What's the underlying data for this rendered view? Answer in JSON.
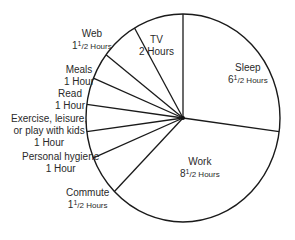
{
  "chart_data": {
    "type": "pie",
    "title": "",
    "unit": "Hours",
    "total": 24,
    "start_angle_deg": -90,
    "direction": "clockwise",
    "slices": [
      {
        "name": "Sleep",
        "value": 6.5,
        "label": "6 1/2 Hours"
      },
      {
        "name": "Work",
        "value": 8.5,
        "label": "8 1/2 Hours"
      },
      {
        "name": "Commute",
        "value": 1.5,
        "label": "1 1/2 Hours"
      },
      {
        "name": "Personal hygiene",
        "value": 1,
        "label": "1 Hour"
      },
      {
        "name": "Exercise, leisure, or play with kids",
        "value": 1,
        "label": "1 Hour"
      },
      {
        "name": "Read",
        "value": 1,
        "label": "1 Hour"
      },
      {
        "name": "Meals",
        "value": 1,
        "label": "1 Hour"
      },
      {
        "name": "Web",
        "value": 1.5,
        "label": "1 1/2 Hours"
      },
      {
        "name": "TV",
        "value": 2,
        "label": "2 Hours"
      }
    ],
    "colors": {
      "fill": "#ffffff",
      "stroke": "#1a1a1a"
    }
  },
  "labels": {
    "sleep": {
      "name": "Sleep",
      "whole": "6",
      "frac_num": "1",
      "frac_den": "/2 Hours"
    },
    "work": {
      "name": "Work",
      "whole": "8",
      "frac_num": "1",
      "frac_den": "/2 Hours"
    },
    "commute": {
      "name": "Commute",
      "whole": "1",
      "frac_num": "1",
      "frac_den": "/2 Hours"
    },
    "hygiene": {
      "name": "Personal hygiene",
      "value": "1 Hour"
    },
    "exercise": {
      "line1": "Exercise, leisure,",
      "line2": "or play with kids",
      "value": "1 Hour"
    },
    "read": {
      "name": "Read",
      "value": "1 Hour"
    },
    "meals": {
      "name": "Meals",
      "value": "1 Hour"
    },
    "web": {
      "name": "Web",
      "whole": "1",
      "frac_num": "1",
      "frac_den": "/2 Hours"
    },
    "tv": {
      "name": "TV",
      "value": "2 Hours"
    }
  }
}
